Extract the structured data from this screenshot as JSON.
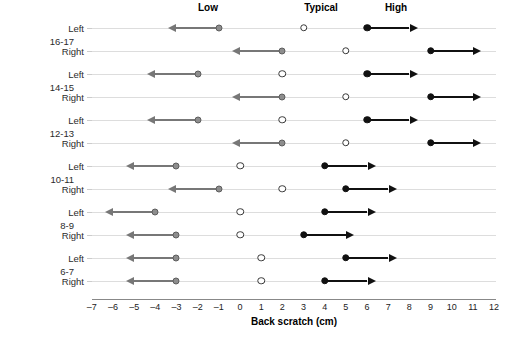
{
  "chart_data": {
    "type": "range-dot",
    "title": "",
    "xlabel": "Back scratch (cm)",
    "ylabel": "Age range (years)",
    "xlim": [
      -7.6,
      12.6
    ],
    "xticks": [
      -7,
      -6,
      -5,
      -4,
      -3,
      -2,
      -1,
      0,
      1,
      2,
      3,
      4,
      5,
      6,
      7,
      8,
      9,
      10,
      11,
      12
    ],
    "xticklabels": [
      "–7",
      "–6",
      "–5",
      "–4",
      "–3",
      "–2",
      "–1",
      "0",
      "1",
      "2",
      "3",
      "4",
      "5",
      "6",
      "7",
      "8",
      "9",
      "10",
      "11",
      "12"
    ],
    "grid": false,
    "legend_position": "top",
    "zone_labels": [
      {
        "text": "Low",
        "x": 208
      },
      {
        "text": "Typical",
        "x": 321
      },
      {
        "text": "High",
        "x": 396
      }
    ],
    "age_groups": [
      "16-17",
      "14-15",
      "12-13",
      "10-11",
      "8-9",
      "6-7"
    ],
    "side_labels": [
      "Left",
      "Right"
    ],
    "rows": [
      {
        "age": "16-17",
        "side": "Left",
        "low_dot": -1,
        "low_arrow_end": -3,
        "typical_dot": 3,
        "high_dot": 6,
        "high_arrow_end": 8
      },
      {
        "age": "16-17",
        "side": "Right",
        "low_dot": 2,
        "low_arrow_end": 0,
        "typical_dot": 5,
        "high_dot": 9,
        "high_arrow_end": 11
      },
      {
        "age": "14-15",
        "side": "Left",
        "low_dot": -2,
        "low_arrow_end": -4,
        "typical_dot": 2,
        "high_dot": 6,
        "high_arrow_end": 8
      },
      {
        "age": "14-15",
        "side": "Right",
        "low_dot": 2,
        "low_arrow_end": 0,
        "typical_dot": 5,
        "high_dot": 9,
        "high_arrow_end": 11
      },
      {
        "age": "12-13",
        "side": "Left",
        "low_dot": -2,
        "low_arrow_end": -4,
        "typical_dot": 2,
        "high_dot": 6,
        "high_arrow_end": 8
      },
      {
        "age": "12-13",
        "side": "Right",
        "low_dot": 2,
        "low_arrow_end": 0,
        "typical_dot": 5,
        "high_dot": 9,
        "high_arrow_end": 11
      },
      {
        "age": "10-11",
        "side": "Left",
        "low_dot": -3,
        "low_arrow_end": -5,
        "typical_dot": 0,
        "high_dot": 4,
        "high_arrow_end": 6
      },
      {
        "age": "10-11",
        "side": "Right",
        "low_dot": -1,
        "low_arrow_end": -3,
        "typical_dot": 2,
        "high_dot": 5,
        "high_arrow_end": 7
      },
      {
        "age": "8-9",
        "side": "Left",
        "low_dot": -4,
        "low_arrow_end": -6,
        "typical_dot": 0,
        "high_dot": 4,
        "high_arrow_end": 6
      },
      {
        "age": "8-9",
        "side": "Right",
        "low_dot": -3,
        "low_arrow_end": -5,
        "typical_dot": 0,
        "high_dot": 3,
        "high_arrow_end": 5
      },
      {
        "age": "6-7",
        "side": "Left",
        "low_dot": -3,
        "low_arrow_end": -5,
        "typical_dot": 1,
        "high_dot": 5,
        "high_arrow_end": 7
      },
      {
        "age": "6-7",
        "side": "Right",
        "low_dot": -3,
        "low_arrow_end": -5,
        "typical_dot": 1,
        "high_dot": 4,
        "high_arrow_end": 6
      }
    ],
    "colors": {
      "low": "#8d8d8d",
      "typical": "#ffffff",
      "high": "#111111",
      "row_line": "#dddddd",
      "axis": "#888888"
    }
  }
}
